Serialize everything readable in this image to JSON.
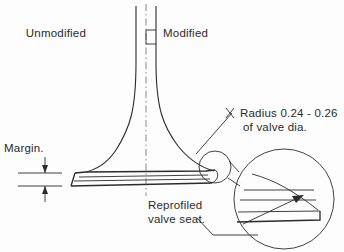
{
  "figure": {
    "background_color": "#fdfdfd",
    "ink_color": "#2b2b2b",
    "centerline_color": "#6b6b6b"
  },
  "labels": {
    "unmodified": "Unmodified",
    "modified": "Modified",
    "margin": "Margin.",
    "radius_line1": "Radius  0.24 - 0.26",
    "radius_line2": "of  valve dia.",
    "reprofiled_line1": "Reprofiled",
    "reprofiled_line2": "valve seat."
  },
  "annotations": {
    "radius_min": "0.24",
    "radius_max": "0.26",
    "radius_reference": "valve dia."
  },
  "parts": {
    "stem": "valve-stem",
    "fillet_left": "unmodified-fillet-profile",
    "fillet_right": "modified-fillet-profile",
    "head": "valve-head",
    "seat": "valve-seat-face",
    "detail_circle_small": "seat-detail-marker",
    "detail_circle_large": "magnified-seat-detail"
  }
}
